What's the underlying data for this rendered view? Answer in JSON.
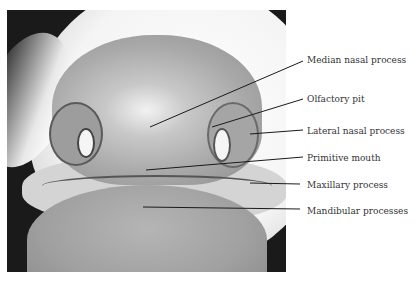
{
  "figure": {
    "labels": [
      {
        "text": "Median nasal process",
        "x": 307,
        "y": 55
      },
      {
        "text": "Olfactory pit",
        "x": 307,
        "y": 94
      },
      {
        "text": "Lateral nasal process",
        "x": 307,
        "y": 126
      },
      {
        "text": "Primitive mouth",
        "x": 307,
        "y": 153
      },
      {
        "text": "Maxillary process",
        "x": 307,
        "y": 180
      },
      {
        "text": "Mandibular processes",
        "x": 307,
        "y": 206
      }
    ],
    "leaders": [
      {
        "x1": 150,
        "y1": 127,
        "x2": 303,
        "y2": 61
      },
      {
        "x1": 212,
        "y1": 127,
        "x2": 303,
        "y2": 99
      },
      {
        "x1": 250,
        "y1": 134,
        "x2": 303,
        "y2": 130
      },
      {
        "x1": 146,
        "y1": 170,
        "x2": 303,
        "y2": 157
      },
      {
        "x1": 250,
        "y1": 183,
        "x2": 300,
        "y2": 184
      },
      {
        "x1": 143,
        "y1": 207,
        "x2": 300,
        "y2": 209
      }
    ]
  }
}
